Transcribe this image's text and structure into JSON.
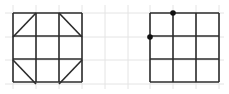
{
  "diagram": {
    "background_grid": {
      "color": "#e4e4e4",
      "x_lines": [
        13,
        36,
        59,
        82,
        105,
        128,
        150,
        173,
        196,
        219
      ],
      "y_lines": [
        13,
        37,
        60,
        84
      ],
      "x_extent": [
        5,
        224
      ],
      "y_extent": [
        5,
        89
      ]
    },
    "stroke_color": "#2b2b2b",
    "dot_color": "#111111",
    "left_figure": {
      "name": "completed-pattern",
      "x": 13,
      "y": 13,
      "cell": 23,
      "cols": 3,
      "rows": 3,
      "diagonals": [
        {
          "x1": 13,
          "y1": 37,
          "x2": 36,
          "y2": 13
        },
        {
          "x1": 59,
          "y1": 13,
          "x2": 82,
          "y2": 37
        },
        {
          "x1": 13,
          "y1": 60,
          "x2": 36,
          "y2": 84
        },
        {
          "x1": 59,
          "y1": 84,
          "x2": 82,
          "y2": 60
        }
      ]
    },
    "right_figure": {
      "name": "blank-pattern-with-points",
      "x": 150,
      "y": 13,
      "cell": 23,
      "cols": 3,
      "rows": 3,
      "dots": [
        {
          "cx": 173,
          "cy": 13
        },
        {
          "cx": 150,
          "cy": 37
        }
      ]
    }
  }
}
